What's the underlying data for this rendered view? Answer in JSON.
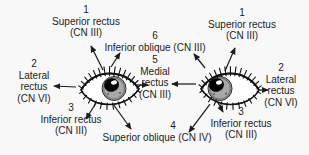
{
  "diagram": {
    "colors": {
      "background": "#f8f8f8",
      "ink": "#1c1c1c",
      "iris": "#a8a8a8",
      "pupil": "#000000"
    },
    "eyes": {
      "left": "left-eye-illustration",
      "right": "right-eye-illustration"
    },
    "labels": {
      "sr_left": {
        "number": "1",
        "line1": "Superior rectus",
        "line2": "(CN III)"
      },
      "sr_right": {
        "number": "1",
        "line1": "Superior rectus",
        "line2": "(CN III)"
      },
      "io": {
        "number": "6",
        "line1": "Inferior oblique (CN III)"
      },
      "mr": {
        "number": "5",
        "line1": "Medial",
        "line2": "rectus",
        "line3": "(CN III)"
      },
      "lr_left": {
        "number": "2",
        "line1": "Lateral",
        "line2": "rectus",
        "line3": "(CN VI)"
      },
      "lr_right": {
        "number": "2",
        "line1": "Lateral",
        "line2": "rectus",
        "line3": "(CN VI)"
      },
      "ir_left": {
        "number": "3",
        "line1": "Inferior rectus",
        "line2": "(CN III)"
      },
      "ir_right": {
        "number": "3",
        "line1": "Inferior rectus",
        "line2": "(CN III)"
      },
      "so": {
        "number": "4",
        "line1": "Superior oblique (CN IV)"
      }
    }
  }
}
